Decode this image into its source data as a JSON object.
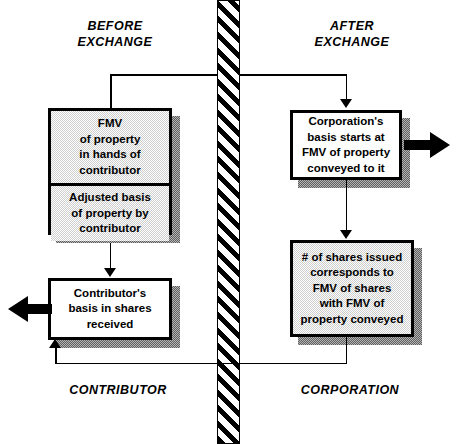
{
  "diagram": {
    "divider": {
      "name": "vertical-hatched-divider",
      "pattern": "diagonal-hatch"
    },
    "colors": {
      "ink": "#000000",
      "box_fill_gray": "#cfcfcf",
      "box_fill_white": "#ffffff",
      "shadow": "#b4b4b4"
    },
    "headers": [
      {
        "id": "before",
        "text": "BEFORE\nEXCHANGE"
      },
      {
        "id": "after",
        "text": "AFTER\nEXCHANGE"
      }
    ],
    "footers": [
      {
        "id": "contributor",
        "text": "CONTRIBUTOR"
      },
      {
        "id": "corporation",
        "text": "CORPORATION"
      }
    ],
    "boxes": [
      {
        "id": "fmv-property",
        "side": "contributor",
        "fill": "gray",
        "text": "FMV\nof property\nin hands of\ncontributor"
      },
      {
        "id": "adjusted-basis",
        "side": "contributor",
        "fill": "gray",
        "text": "Adjusted basis\nof property by\ncontributor"
      },
      {
        "id": "contributor-basis-shares",
        "side": "contributor",
        "fill": "white",
        "text": "Contributor's\nbasis in shares\nreceived"
      },
      {
        "id": "corporation-basis",
        "side": "corporation",
        "fill": "white",
        "text": "Corporation's\nbasis starts at\nFMV of property\nconveyed to it"
      },
      {
        "id": "shares-issued",
        "side": "corporation",
        "fill": "gray",
        "text": "# of shares issued\ncorresponds to\nFMV of shares\nwith FMV of\nproperty conveyed"
      }
    ],
    "connectors": [
      {
        "id": "fmv-to-corporation-basis",
        "from": "fmv-property",
        "to": "corporation-basis",
        "style": "thin",
        "arrow": "down"
      },
      {
        "id": "adjusted-basis-to-contributor-basis",
        "from": "adjusted-basis",
        "to": "contributor-basis-shares",
        "style": "thin",
        "arrow": "down"
      },
      {
        "id": "corporation-basis-to-shares-issued",
        "from": "corporation-basis",
        "to": "shares-issued",
        "style": "thin",
        "arrow": "down"
      },
      {
        "id": "shares-issued-to-contributor-basis",
        "from": "shares-issued",
        "to": "contributor-basis-shares",
        "style": "thin",
        "arrow": "up"
      },
      {
        "id": "corporation-basis-out",
        "from": "corporation-basis",
        "to": "external-right",
        "style": "thick",
        "arrow": "right"
      },
      {
        "id": "contributor-basis-out",
        "from": "contributor-basis-shares",
        "to": "external-left",
        "style": "thick",
        "arrow": "left"
      }
    ]
  }
}
